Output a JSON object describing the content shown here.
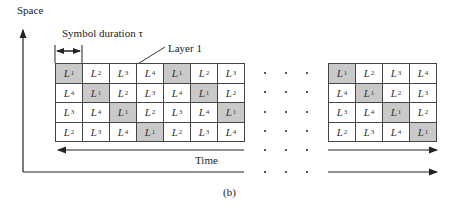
{
  "labels": {
    "y_axis": "Space",
    "x_axis": "Time",
    "symbol_duration": "Symbol duration τ",
    "layer": "Layer 1",
    "caption": "(b)"
  },
  "colors": {
    "shaded": "#c9c9c9",
    "line": "#222222"
  },
  "left_grid": {
    "rows": [
      [
        {
          "t": "L",
          "s": "1",
          "shaded": true
        },
        {
          "t": "L",
          "s": "2"
        },
        {
          "t": "L",
          "s": "3"
        },
        {
          "t": "L",
          "s": "4"
        },
        {
          "t": "L",
          "s": "1",
          "shaded": true
        },
        {
          "t": "L",
          "s": "2"
        },
        {
          "t": "L",
          "s": "3"
        }
      ],
      [
        {
          "t": "L",
          "s": "4"
        },
        {
          "t": "L",
          "s": "1",
          "shaded": true
        },
        {
          "t": "L",
          "s": "2"
        },
        {
          "t": "L",
          "s": "3"
        },
        {
          "t": "L",
          "s": "4"
        },
        {
          "t": "L",
          "s": "1",
          "shaded": true
        },
        {
          "t": "L",
          "s": "2"
        }
      ],
      [
        {
          "t": "L",
          "s": "3"
        },
        {
          "t": "L",
          "s": "4"
        },
        {
          "t": "L",
          "s": "1",
          "shaded": true
        },
        {
          "t": "L",
          "s": "2"
        },
        {
          "t": "L",
          "s": "3"
        },
        {
          "t": "L",
          "s": "4"
        },
        {
          "t": "L",
          "s": "1",
          "shaded": true
        }
      ],
      [
        {
          "t": "L",
          "s": "2"
        },
        {
          "t": "L",
          "s": "3"
        },
        {
          "t": "L",
          "s": "4"
        },
        {
          "t": "L",
          "s": "1",
          "shaded": true
        },
        {
          "t": "L",
          "s": "2"
        },
        {
          "t": "L",
          "s": "3"
        },
        {
          "t": "L",
          "s": "4"
        }
      ]
    ]
  },
  "right_grid": {
    "rows": [
      [
        {
          "t": "L",
          "s": "1",
          "shaded": true
        },
        {
          "t": "L",
          "s": "2"
        },
        {
          "t": "L",
          "s": "3"
        },
        {
          "t": "L",
          "s": "4"
        }
      ],
      [
        {
          "t": "L",
          "s": "4"
        },
        {
          "t": "L",
          "s": "1",
          "shaded": true
        },
        {
          "t": "L",
          "s": "2"
        },
        {
          "t": "L",
          "s": "3"
        }
      ],
      [
        {
          "t": "L",
          "s": "3"
        },
        {
          "t": "L",
          "s": "4"
        },
        {
          "t": "L",
          "s": "1",
          "shaded": true
        },
        {
          "t": "L",
          "s": "2"
        }
      ],
      [
        {
          "t": "L",
          "s": "2"
        },
        {
          "t": "L",
          "s": "3"
        },
        {
          "t": "L",
          "s": "4"
        },
        {
          "t": "L",
          "s": "1",
          "shaded": true
        }
      ]
    ]
  },
  "ellipsis_rows": 6
}
